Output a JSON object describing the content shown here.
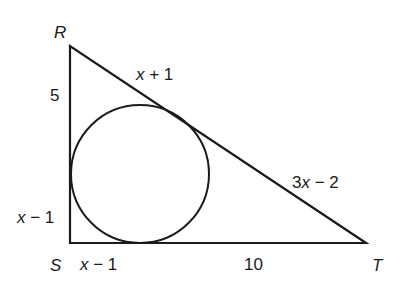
{
  "diagram": {
    "type": "triangle-with-inscribed-circle",
    "vertices": {
      "R": {
        "label": "R",
        "x": 70,
        "y": 46
      },
      "S": {
        "label": "S",
        "x": 70,
        "y": 243
      },
      "T": {
        "label": "T",
        "x": 366,
        "y": 243
      }
    },
    "circle": {
      "cx": 140,
      "cy": 174,
      "r": 69
    },
    "segment_labels": {
      "RS_upper": {
        "var": "",
        "text": "5"
      },
      "RS_lower": {
        "var": "x",
        "rest": " − 1"
      },
      "ST_left": {
        "var": "x",
        "rest": " − 1"
      },
      "ST_right": {
        "var": "",
        "text": "10"
      },
      "RT_upper": {
        "var": "x",
        "rest": " + 1"
      },
      "RT_lower": {
        "pre": "3",
        "var": "x",
        "rest": " − 2"
      }
    },
    "stroke_color": "#1a1a1a"
  }
}
